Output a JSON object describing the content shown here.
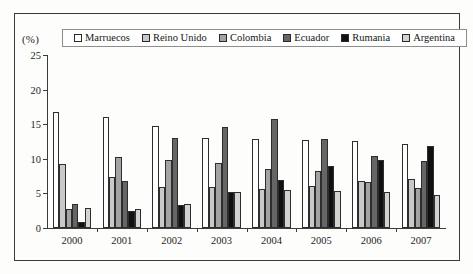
{
  "unit_label": "(%)",
  "legend": {
    "items": [
      {
        "label": "Marruecos",
        "swatch": "white-square-icon"
      },
      {
        "label": "Reino Unido",
        "swatch": "light-gray-square-icon"
      },
      {
        "label": "Colombia",
        "swatch": "medium-gray-square-icon"
      },
      {
        "label": "Ecuador",
        "swatch": "dark-gray-square-icon"
      },
      {
        "label": "Rumania",
        "swatch": "black-square-icon"
      },
      {
        "label": "Argentina",
        "swatch": "pale-gray-square-icon"
      }
    ]
  },
  "chart_data": {
    "type": "bar",
    "title": "",
    "subtitle": "",
    "xlabel": "",
    "ylabel": "(%)",
    "ylim": [
      0,
      25
    ],
    "yticks": [
      0,
      5,
      10,
      15,
      20,
      25
    ],
    "grid": false,
    "legend_position": "top",
    "categories": [
      "2000",
      "2001",
      "2002",
      "2003",
      "2004",
      "2005",
      "2006",
      "2007"
    ],
    "series": [
      {
        "name": "Marruecos",
        "color": "#ffffff",
        "values": [
          16.8,
          16.1,
          14.8,
          13.0,
          12.8,
          12.7,
          12.6,
          12.1
        ]
      },
      {
        "name": "Reino Unido",
        "color": "#c9c9c9",
        "values": [
          9.2,
          7.3,
          5.9,
          5.9,
          5.6,
          6.0,
          6.8,
          7.1
        ]
      },
      {
        "name": "Colombia",
        "color": "#a3a3a3",
        "values": [
          2.8,
          10.2,
          9.8,
          9.4,
          8.6,
          8.2,
          6.7,
          5.8
        ]
      },
      {
        "name": "Ecuador",
        "color": "#666666",
        "values": [
          3.5,
          6.8,
          13.0,
          14.6,
          15.7,
          12.9,
          10.4,
          9.7
        ]
      },
      {
        "name": "Rumania",
        "color": "#111111",
        "values": [
          0.8,
          2.4,
          3.3,
          5.2,
          6.9,
          9.0,
          9.8,
          11.8
        ]
      },
      {
        "name": "Argentina",
        "color": "#d2d2d2",
        "values": [
          2.9,
          2.7,
          3.4,
          5.2,
          5.5,
          5.4,
          5.2,
          4.7
        ]
      }
    ]
  }
}
